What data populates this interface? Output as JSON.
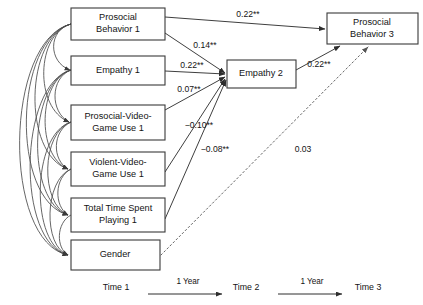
{
  "diagram": {
    "type": "path-diagram",
    "nodes": [
      {
        "id": "prosocial_behavior_1",
        "label_line1": "Prosocial",
        "label_line2": "Behavior 1",
        "x": 71,
        "y": 8,
        "w": 94,
        "h": 32
      },
      {
        "id": "empathy_1",
        "label_line1": "Empathy 1",
        "label_line2": "",
        "x": 71,
        "y": 56,
        "w": 94,
        "h": 29
      },
      {
        "id": "prosocial_video_game_use_1",
        "label_line1": "Prosocial-Video-",
        "label_line2": "Game Use 1",
        "x": 71,
        "y": 105,
        "w": 94,
        "h": 35
      },
      {
        "id": "violent_video_game_use_1",
        "label_line1": "Violent-Video-",
        "label_line2": "Game Use 1",
        "x": 71,
        "y": 152,
        "w": 94,
        "h": 34
      },
      {
        "id": "total_time_spent_playing_1",
        "label_line1": "Total Time Spent",
        "label_line2": "Playing 1",
        "x": 71,
        "y": 198,
        "w": 94,
        "h": 34
      },
      {
        "id": "gender",
        "label_line1": "Gender",
        "label_line2": "",
        "x": 71,
        "y": 240,
        "w": 89,
        "h": 30
      },
      {
        "id": "empathy_2",
        "label_line1": "Empathy 2",
        "label_line2": "",
        "x": 227,
        "y": 60,
        "w": 69,
        "h": 28
      },
      {
        "id": "prosocial_behavior_3",
        "label_line1": "Prosocial",
        "label_line2": "Behavior 3",
        "x": 327,
        "y": 13,
        "w": 91,
        "h": 31
      }
    ],
    "paths": [
      {
        "id": "pb1_to_pb3",
        "from": "prosocial_behavior_1",
        "to": "prosocial_behavior_3",
        "coefficient": "0.22**",
        "label_x": 248,
        "label_y": 15,
        "style": "solid"
      },
      {
        "id": "pb1_to_emp2",
        "from": "prosocial_behavior_1",
        "to": "empathy_2",
        "coefficient": "0.14**",
        "label_x": 205,
        "label_y": 46,
        "style": "solid"
      },
      {
        "id": "emp1_to_emp2",
        "from": "empathy_1",
        "to": "empathy_2",
        "coefficient": "0.22**",
        "label_x": 192,
        "label_y": 66,
        "style": "solid"
      },
      {
        "id": "pvgu1_to_emp2",
        "from": "prosocial_video_game_use_1",
        "to": "empathy_2",
        "coefficient": "0.07**",
        "label_x": 189,
        "label_y": 90,
        "style": "solid"
      },
      {
        "id": "vvgu1_to_emp2",
        "from": "violent_video_game_use_1",
        "to": "empathy_2",
        "coefficient": "−0.10**",
        "label_x": 199,
        "label_y": 126,
        "style": "solid"
      },
      {
        "id": "ttsp1_to_emp2",
        "from": "total_time_spent_playing_1",
        "to": "empathy_2",
        "coefficient": "−0.08**",
        "label_x": 215,
        "label_y": 150,
        "style": "solid"
      },
      {
        "id": "emp2_to_pb3",
        "from": "empathy_2",
        "to": "prosocial_behavior_3",
        "coefficient": "0.22**",
        "label_x": 319,
        "label_y": 65,
        "style": "solid"
      },
      {
        "id": "gender_to_pb3",
        "from": "gender",
        "to": "prosocial_behavior_3",
        "coefficient": "0.03",
        "label_x": 303,
        "label_y": 150,
        "style": "dotted"
      }
    ],
    "timeline": {
      "points": [
        {
          "id": "time-1",
          "label": "Time 1",
          "x": 116,
          "y": 288
        },
        {
          "id": "time-2",
          "label": "Time 2",
          "x": 246,
          "y": 288
        },
        {
          "id": "time-3",
          "label": "Time 3",
          "x": 368,
          "y": 288
        }
      ],
      "intervals": [
        {
          "id": "interval-1",
          "label": "1 Year",
          "x": 188,
          "y": 282,
          "arrow_x1": 148,
          "arrow_x2": 228,
          "arrow_y": 294
        },
        {
          "id": "interval-2",
          "label": "1 Year",
          "x": 312,
          "y": 282,
          "arrow_x1": 278,
          "arrow_x2": 348,
          "arrow_y": 294
        }
      ]
    },
    "colors": {
      "box_stroke": "#3a3a3a",
      "path_stroke": "#3f3f3f",
      "dotted_stroke": "#666666",
      "text": "#141414",
      "background": "#ffffff"
    }
  }
}
